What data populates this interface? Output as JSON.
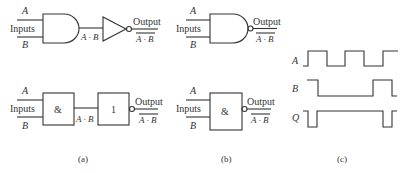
{
  "panel_a": {
    "caption": "(a)",
    "top": {
      "input_a": "A",
      "inputs_label": "Inputs",
      "input_b": "B",
      "intermediate": "A · B",
      "output_label": "Output",
      "output_expr": "A · B",
      "gates": [
        "and-gate",
        "not-gate"
      ]
    },
    "bottom": {
      "input_a": "A",
      "inputs_label": "Inputs",
      "input_b": "B",
      "and_symbol": "&",
      "intermediate": "A · B",
      "not_symbol": "1",
      "output_label": "Output",
      "output_expr": "A · B"
    }
  },
  "panel_b": {
    "caption": "(b)",
    "top": {
      "input_a": "A",
      "inputs_label": "Inputs",
      "input_b": "B",
      "output_label": "Output",
      "output_expr": "A · B",
      "gate": "nand-gate"
    },
    "bottom": {
      "input_a": "A",
      "inputs_label": "Inputs",
      "input_b": "B",
      "and_symbol": "&",
      "output_label": "Output",
      "output_expr": "A · B"
    }
  },
  "panel_c": {
    "caption": "(c)",
    "signals": [
      {
        "name": "A",
        "levels": [
          0,
          1,
          0,
          1,
          0,
          1
        ]
      },
      {
        "name": "B",
        "levels": [
          1,
          0,
          1,
          0
        ]
      },
      {
        "name": "Q",
        "levels": [
          1,
          0,
          1,
          0,
          1
        ]
      }
    ]
  }
}
